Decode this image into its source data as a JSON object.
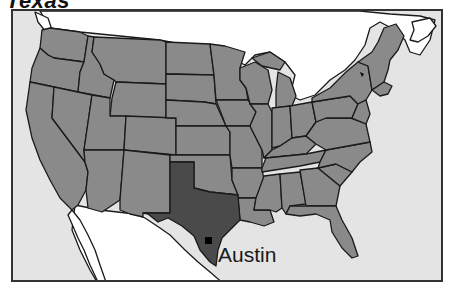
{
  "map": {
    "title": "Texas",
    "highlighted_region": "Texas",
    "city_label": "Austin",
    "city_marker": {
      "x": 208,
      "y": 240
    },
    "colors": {
      "water": "#e4e4e4",
      "states": "#8a8a8a",
      "highlight": "#4a4a4a",
      "foreign_land": "#ffffff",
      "borders": "#1a1a1a",
      "marker": "#000000"
    },
    "other_markers": [
      {
        "name": "state-capital-dot",
        "x": 362,
        "y": 74
      }
    ]
  }
}
